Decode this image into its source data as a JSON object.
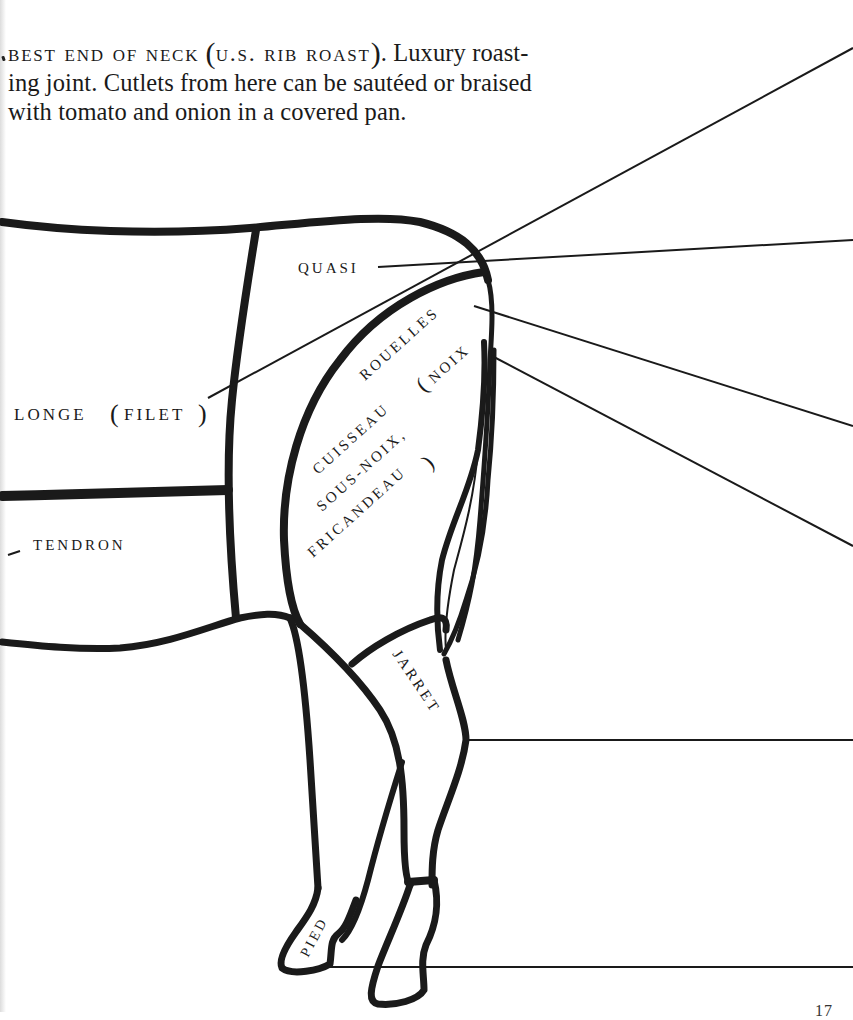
{
  "caption": {
    "heading_smallcaps": "BEST END OF NECK",
    "heading_paren_smallcaps": "U.S. RIB ROAST",
    "line1_rest": ". Luxury roast-",
    "line2": "ing joint. Cutlets from here can be sautéed or braised",
    "line3": "with tomato and onion in a covered pan."
  },
  "diagram": {
    "labels": {
      "quasi": "QUASI",
      "longe": "LONGE",
      "longe_paren": "FILET",
      "tendron": "TENDRON",
      "rouelles": "ROUELLES",
      "cuisseau_line1": "CUISSEAU",
      "cuisseau_line1_paren": "NOIX",
      "cuisseau_line2": "SOUS-NOIX,",
      "cuisseau_line3": "FRICANDEAU",
      "jarret": "JARRET",
      "pied": "PIED"
    },
    "colors": {
      "ink": "#1a1a1a",
      "paper": "#ffffff"
    }
  },
  "page": {
    "number": "17"
  }
}
